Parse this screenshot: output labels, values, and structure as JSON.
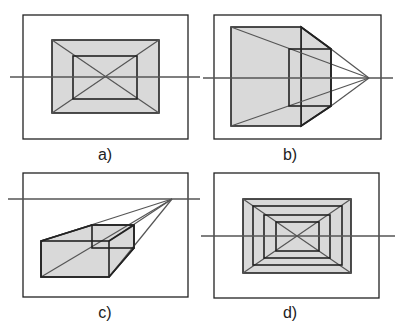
{
  "panels": [
    {
      "id": "a",
      "label": "a)",
      "description": "one-point perspective, vanishing point centered in frame"
    },
    {
      "id": "b",
      "label": "b)",
      "description": "one-point perspective, vanishing point to the right"
    },
    {
      "id": "c",
      "label": "c)",
      "description": "one-point perspective, box below horizon with vanishing point upper right"
    },
    {
      "id": "d",
      "label": "d)",
      "description": "nested rectangles converging to central vanishing point"
    }
  ],
  "colors": {
    "stroke": "#222222",
    "fill": "#d9d9d9",
    "horizon": "#555555"
  }
}
